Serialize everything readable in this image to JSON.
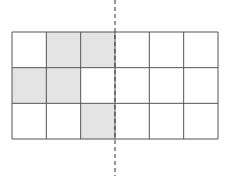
{
  "diagram": {
    "type": "grid-symmetry",
    "rows": 3,
    "cols": 6,
    "shaded_cells": [
      [
        0,
        1
      ],
      [
        0,
        2
      ],
      [
        1,
        0
      ],
      [
        1,
        1
      ],
      [
        2,
        2
      ]
    ],
    "colors": {
      "shade": "#e4e4e4",
      "line": "#555555",
      "axis": "#333333",
      "background": "#ffffff"
    },
    "axis_of_symmetry": {
      "style": "dashed",
      "orientation": "vertical",
      "between_columns": [
        2,
        3
      ]
    }
  }
}
